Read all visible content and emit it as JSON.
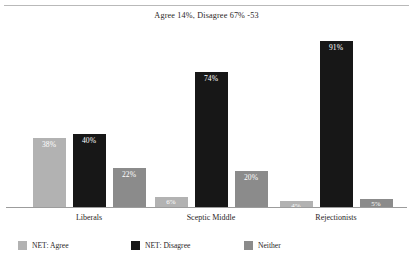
{
  "chart_data": {
    "type": "bar",
    "title": "Agree 14%, Disagree 67% -53",
    "xlabel": "",
    "ylabel": "",
    "ylim": [
      0,
      100
    ],
    "grid": false,
    "legend_position": "bottom",
    "categories": [
      "Liberals",
      "Sceptic Middle",
      "Rejectionists"
    ],
    "series": [
      {
        "name": "NET: Agree",
        "color": "#b2b2b2",
        "values": [
          38,
          40,
          22
        ],
        "labels": [
          "38%",
          "40%",
          "22%"
        ]
      },
      {
        "name": "NET: Disagree",
        "color": "#171717",
        "values": [
          6,
          74,
          20
        ],
        "labels": [
          "6%",
          "74%",
          "20%"
        ]
      },
      {
        "name": "Neither",
        "color": "#8b8b8b",
        "values": [
          4,
          91,
          5
        ],
        "labels": [
          "4%",
          "91%",
          "5%"
        ]
      }
    ],
    "groups": [
      {
        "category": "Liberals",
        "bars": [
          {
            "series": "NET: Agree",
            "value": 38,
            "label": "38%",
            "color": "#b2b2b2"
          },
          {
            "series": "NET: Disagree",
            "value": 40,
            "label": "40%",
            "color": "#171717"
          },
          {
            "series": "Neither",
            "value": 22,
            "label": "22%",
            "color": "#8b8b8b"
          }
        ]
      },
      {
        "category": "Sceptic Middle",
        "bars": [
          {
            "series": "NET: Agree",
            "value": 6,
            "label": "6%",
            "color": "#b2b2b2"
          },
          {
            "series": "NET: Disagree",
            "value": 74,
            "label": "74%",
            "color": "#171717"
          },
          {
            "series": "Neither",
            "value": 20,
            "label": "20%",
            "color": "#8b8b8b"
          }
        ]
      },
      {
        "category": "Rejectionists",
        "bars": [
          {
            "series": "NET: Agree",
            "value": 4,
            "label": "4%",
            "color": "#b2b2b2"
          },
          {
            "series": "NET: Disagree",
            "value": 91,
            "label": "91%",
            "color": "#171717"
          },
          {
            "series": "Neither",
            "value": 5,
            "label": "5%",
            "color": "#8b8b8b"
          }
        ]
      }
    ]
  },
  "legend": {
    "items": [
      {
        "label": "NET: Agree",
        "color": "#b2b2b2"
      },
      {
        "label": "NET: Disagree",
        "color": "#171717"
      },
      {
        "label": "Neither",
        "color": "#8b8b8b"
      }
    ]
  }
}
